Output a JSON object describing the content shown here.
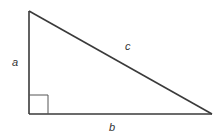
{
  "diagram": {
    "labels": {
      "a": "a",
      "b": "b",
      "c": "c"
    },
    "vertices": {
      "top": [
        29,
        11
      ],
      "right_angle": [
        29,
        114
      ],
      "right": [
        212,
        114
      ]
    },
    "right_angle_marker_size": 19,
    "colors": {
      "stroke": "#3a3a3a",
      "marker": "#555555",
      "label": "#333333",
      "background": "#ffffff"
    }
  }
}
